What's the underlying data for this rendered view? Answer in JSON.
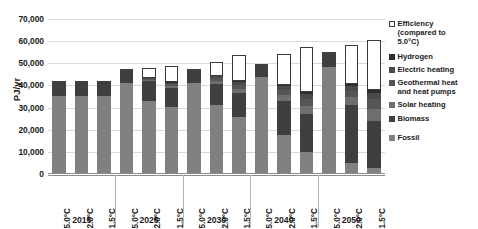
{
  "chart_data": {
    "type": "bar",
    "stacked": true,
    "title": "",
    "subtitle": "",
    "xlabel": "",
    "ylabel": "PJ/yr",
    "ylim": [
      0,
      70000
    ],
    "ytick_labels": [
      "0",
      "10,000",
      "20,000",
      "30,000",
      "40,000",
      "50,000",
      "60,000",
      "70,000"
    ],
    "ytick_values": [
      0,
      10000,
      20000,
      30000,
      40000,
      50000,
      60000,
      70000
    ],
    "grid": true,
    "legend_position": "right",
    "group_labels": [
      "2015",
      "2025",
      "2030",
      "2040",
      "2050"
    ],
    "scenario_labels": [
      "5.0°C",
      "2.0°C",
      "1.5°C"
    ],
    "categories": [
      "2015 5.0°C",
      "2015 2.0°C",
      "2015 1.5°C",
      "2025 5.0°C",
      "2025 2.0°C",
      "2025 1.5°C",
      "2030 5.0°C",
      "2030 2.0°C",
      "2030 1.5°C",
      "2040 5.0°C",
      "2040 2.0°C",
      "2040 1.5°C",
      "2050 5.0°C",
      "2050 2.0°C",
      "2050 1.5°C"
    ],
    "series": [
      {
        "name": "Fossil",
        "color": "#808080",
        "values": [
          35200,
          35200,
          35200,
          41300,
          33200,
          30200,
          41000,
          31000,
          25800,
          44000,
          17500,
          10000,
          48500,
          5200,
          2500
        ]
      },
      {
        "name": "Biomass",
        "color": "#3f3f3f",
        "values": [
          6800,
          6800,
          6800,
          6100,
          8600,
          8800,
          6300,
          9700,
          10600,
          5800,
          15500,
          17000,
          6800,
          26200,
          21500
        ]
      },
      {
        "name": "Solar heating",
        "color": "#6e6e6e",
        "values": [
          0,
          0,
          0,
          0,
          600,
          900,
          0,
          1300,
          2000,
          0,
          2600,
          3700,
          0,
          3300,
          5200
        ]
      },
      {
        "name": "Geothermal heat and heat pumps",
        "color": "#555555",
        "values": [
          0,
          0,
          0,
          0,
          500,
          800,
          0,
          1200,
          1800,
          0,
          2400,
          3300,
          0,
          3000,
          4600
        ]
      },
      {
        "name": "Electric heating",
        "color": "#4a4a4a",
        "values": [
          0,
          0,
          0,
          0,
          400,
          600,
          0,
          900,
          1300,
          0,
          1600,
          2200,
          0,
          2000,
          3000
        ]
      },
      {
        "name": "Hydrogen",
        "color": "#2e2e2e",
        "values": [
          0,
          0,
          0,
          0,
          200,
          300,
          0,
          400,
          600,
          0,
          700,
          900,
          0,
          900,
          1300
        ]
      },
      {
        "name": "Efficiency (compared to 5.0°C)",
        "color": "#ffffff",
        "outlined": true,
        "values": [
          0,
          0,
          0,
          0,
          4400,
          7100,
          0,
          6000,
          11700,
          0,
          13800,
          20200,
          0,
          17800,
          22400
        ]
      }
    ]
  },
  "legend": {
    "items": [
      {
        "label": "Efficiency\n(compared to\n5.0°C)",
        "color": "#ffffff",
        "outlined": true
      },
      {
        "label": "Hydrogen",
        "color": "#2e2e2e",
        "outlined": false
      },
      {
        "label": "Electric heating",
        "color": "#4a4a4a",
        "outlined": false
      },
      {
        "label": "Geothermal heat\nand heat pumps",
        "color": "#555555",
        "outlined": false
      },
      {
        "label": "Solar heating",
        "color": "#6e6e6e",
        "outlined": false
      },
      {
        "label": "Biomass",
        "color": "#3f3f3f",
        "outlined": false
      },
      {
        "label": "Fossil",
        "color": "#808080",
        "outlined": false
      }
    ]
  }
}
